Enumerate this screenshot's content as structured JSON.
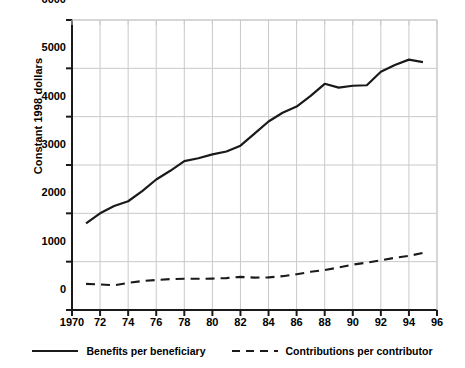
{
  "chart_data": {
    "type": "line",
    "title": "",
    "xlabel": "",
    "ylabel": "Constant 1998 dollars",
    "xlim": [
      1970,
      1996
    ],
    "ylim": [
      0,
      6000
    ],
    "grid": true,
    "legend_position": "bottom",
    "x_tick_labels": [
      "1970",
      "72",
      "74",
      "76",
      "78",
      "80",
      "82",
      "84",
      "86",
      "88",
      "90",
      "92",
      "94",
      "96"
    ],
    "x_tick_values": [
      1970,
      1972,
      1974,
      1976,
      1978,
      1980,
      1982,
      1984,
      1986,
      1988,
      1990,
      1992,
      1994,
      1996
    ],
    "y_tick_labels": [
      "0",
      "1000",
      "2000",
      "3000",
      "4000",
      "5000",
      "6000"
    ],
    "y_tick_values": [
      0,
      1000,
      2000,
      3000,
      4000,
      5000,
      6000
    ],
    "x": [
      1971,
      1972,
      1973,
      1974,
      1975,
      1976,
      1977,
      1978,
      1979,
      1980,
      1981,
      1982,
      1983,
      1984,
      1985,
      1986,
      1987,
      1988,
      1989,
      1990,
      1991,
      1992,
      1993,
      1994,
      1995
    ],
    "series": [
      {
        "name": "Benefits per beneficiary",
        "style": "solid",
        "color": "#1a1a1a",
        "values": [
          1790,
          2000,
          2150,
          2250,
          2460,
          2700,
          2880,
          3080,
          3140,
          3220,
          3280,
          3400,
          3650,
          3900,
          4080,
          4210,
          4430,
          4680,
          4600,
          4640,
          4650,
          4930,
          5070,
          5180,
          5130
        ]
      },
      {
        "name": "Contributions per contributor",
        "style": "dashed",
        "color": "#1a1a1a",
        "values": [
          540,
          530,
          510,
          560,
          600,
          620,
          640,
          645,
          645,
          650,
          660,
          685,
          670,
          675,
          700,
          740,
          790,
          825,
          880,
          940,
          980,
          1030,
          1080,
          1120,
          1180
        ]
      }
    ]
  },
  "legend": {
    "items": [
      {
        "label": "Benefits per beneficiary",
        "style": "solid"
      },
      {
        "label": "Contributions per contributor",
        "style": "dashed"
      }
    ]
  },
  "colors": {
    "line": "#1a1a1a",
    "grid": "#c9c9c9",
    "axis": "#1a1a1a",
    "background": "#ffffff",
    "text": "#000000"
  }
}
